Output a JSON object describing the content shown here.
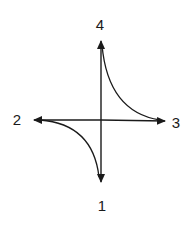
{
  "diagram": {
    "center": {
      "x": 101,
      "y": 120
    },
    "line_color": "#1a1a1a",
    "nodes": [
      {
        "id": "1",
        "label": "1",
        "position": "bottom",
        "arrow_tip": {
          "x": 101,
          "y": 183
        },
        "label_pos": {
          "x": 102,
          "y": 205
        }
      },
      {
        "id": "2",
        "label": "2",
        "position": "left",
        "arrow_tip": {
          "x": 33,
          "y": 120
        },
        "label_pos": {
          "x": 17,
          "y": 119
        }
      },
      {
        "id": "3",
        "label": "3",
        "position": "right",
        "arrow_tip": {
          "x": 166,
          "y": 121
        },
        "label_pos": {
          "x": 176,
          "y": 122
        }
      },
      {
        "id": "4",
        "label": "4",
        "position": "top",
        "arrow_tip": {
          "x": 101,
          "y": 40
        },
        "label_pos": {
          "x": 100,
          "y": 24
        }
      }
    ],
    "curves": [
      {
        "from": "4",
        "to": "3",
        "shape": "concave",
        "note": "curve from top arrow tip sweeping down to right arrow tip"
      },
      {
        "from": "2",
        "to": "1",
        "shape": "concave",
        "note": "curve from left arrow tip sweeping down to bottom arrow tip"
      }
    ]
  }
}
